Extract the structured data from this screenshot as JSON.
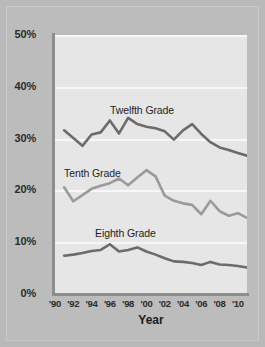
{
  "chart_data": {
    "type": "line",
    "title": "",
    "xlabel": "Year",
    "ylabel": "",
    "xlim": [
      1990,
      2011
    ],
    "ylim": [
      0,
      50
    ],
    "grid": true,
    "legend_position": "inline-labels",
    "x": [
      1991,
      1992,
      1993,
      1994,
      1995,
      1996,
      1997,
      1998,
      1999,
      2000,
      2001,
      2002,
      2003,
      2004,
      2005,
      2006,
      2007,
      2008,
      2009,
      2010,
      2011
    ],
    "x_tick_labels": [
      "'90",
      "'92",
      "'94",
      "'96",
      "'98",
      "'00",
      "'02",
      "'04",
      "'06",
      "'08",
      "'10"
    ],
    "x_tick_values": [
      1990,
      1992,
      1994,
      1996,
      1998,
      2000,
      2002,
      2004,
      2006,
      2008,
      2010
    ],
    "y_tick_labels": [
      "0%",
      "10%",
      "20%",
      "30%",
      "40%",
      "50%"
    ],
    "y_tick_values": [
      0,
      10,
      20,
      30,
      40,
      50
    ],
    "series": [
      {
        "name": "Twelfth Grade",
        "color": "#6b6b6b",
        "values": [
          31.6,
          30.1,
          28.6,
          30.8,
          31.2,
          33.5,
          31.0,
          34.0,
          32.8,
          32.3,
          32.0,
          31.4,
          29.8,
          31.6,
          32.8,
          30.9,
          29.3,
          28.3,
          27.8,
          27.2,
          26.7
        ]
      },
      {
        "name": "Tenth Grade",
        "color": "#9a9a9a",
        "values": [
          20.6,
          17.9,
          19.1,
          20.3,
          20.9,
          21.4,
          22.3,
          21.0,
          22.5,
          23.9,
          22.7,
          19.0,
          18.0,
          17.5,
          17.2,
          15.4,
          18.0,
          16.0,
          15.1,
          15.6,
          14.7
        ]
      },
      {
        "name": "Eighth Grade",
        "color": "#6b6b6b",
        "values": [
          7.4,
          7.6,
          7.9,
          8.3,
          8.5,
          9.6,
          8.2,
          8.5,
          9.0,
          8.2,
          7.6,
          6.9,
          6.3,
          6.2,
          6.0,
          5.6,
          6.2,
          5.7,
          5.6,
          5.4,
          5.1
        ]
      }
    ]
  },
  "axes": {
    "x_title": "Year"
  }
}
